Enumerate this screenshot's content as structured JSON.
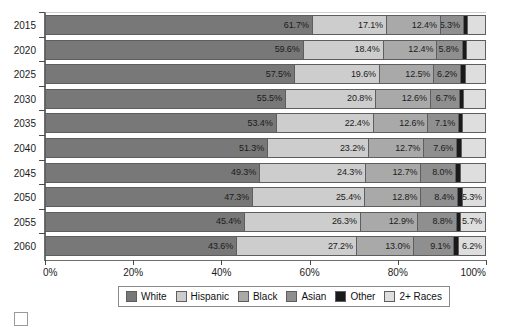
{
  "chart_data": {
    "type": "bar",
    "orientation": "horizontal",
    "stacked": true,
    "stack_mode": "percent",
    "title": "",
    "subtitle": "",
    "xlabel": "",
    "ylabel": "",
    "xlim": [
      0,
      100
    ],
    "grid": false,
    "legend_position": "bottom",
    "categories": [
      "2015",
      "2020",
      "2025",
      "2030",
      "2035",
      "2040",
      "2045",
      "2050",
      "2055",
      "2060"
    ],
    "xticks": [
      0,
      20,
      40,
      60,
      80,
      100
    ],
    "xticklabels": [
      "0%",
      "20%",
      "40%",
      "60%",
      "80%",
      "100%"
    ],
    "series": [
      {
        "name": "White",
        "color": "#787878",
        "values": [
          61.7,
          59.6,
          57.5,
          55.5,
          53.4,
          51.3,
          49.3,
          47.3,
          45.4,
          43.6
        ]
      },
      {
        "name": "Hispanic",
        "color": "#cdcdcd",
        "values": [
          17.1,
          18.4,
          19.6,
          20.8,
          22.4,
          23.2,
          24.3,
          25.4,
          26.3,
          27.2
        ]
      },
      {
        "name": "Black",
        "color": "#a9a9a9",
        "values": [
          12.4,
          12.4,
          12.5,
          12.6,
          12.6,
          12.7,
          12.7,
          12.8,
          12.9,
          13.0
        ]
      },
      {
        "name": "Asian",
        "color": "#8f8f8f",
        "values": [
          5.3,
          5.8,
          6.2,
          6.7,
          7.1,
          7.6,
          8.0,
          8.4,
          8.8,
          9.1
        ]
      },
      {
        "name": "Other",
        "color": "#1a1a1a",
        "values": [
          1.0,
          1.0,
          1.0,
          1.0,
          1.0,
          1.0,
          1.0,
          1.0,
          1.0,
          1.0
        ]
      },
      {
        "name": "2+ Races",
        "color": "#dedede",
        "values": [
          4.1,
          4.4,
          4.7,
          5.0,
          5.2,
          5.6,
          5.8,
          5.3,
          5.7,
          6.2
        ]
      }
    ],
    "bar_labels": [
      [
        "61.7%",
        "17.1%",
        "12.4%",
        "5.3%",
        "",
        ""
      ],
      [
        "59.6%",
        "18.4%",
        "12.4%",
        "5.8%",
        "",
        ""
      ],
      [
        "57.5%",
        "19.6%",
        "12.5%",
        "6.2%",
        "",
        ""
      ],
      [
        "55.5%",
        "20.8%",
        "12.6%",
        "6.7%",
        "",
        ""
      ],
      [
        "53.4%",
        "22.4%",
        "12.6%",
        "7.1%",
        "",
        ""
      ],
      [
        "51.3%",
        "23.2%",
        "12.7%",
        "7.6%",
        "",
        ""
      ],
      [
        "49.3%",
        "24.3%",
        "12.7%",
        "8.0%",
        "",
        ""
      ],
      [
        "47.3%",
        "25.4%",
        "12.8%",
        "8.4%",
        "",
        "5.3%"
      ],
      [
        "45.4%",
        "26.3%",
        "12.9%",
        "8.8%",
        "",
        "5.7%"
      ],
      [
        "43.6%",
        "27.2%",
        "13.0%",
        "9.1%",
        "",
        "6.2%"
      ]
    ]
  },
  "legend": {
    "items": [
      {
        "label": "White",
        "color": "#787878"
      },
      {
        "label": "Hispanic",
        "color": "#cdcdcd"
      },
      {
        "label": "Black",
        "color": "#a9a9a9"
      },
      {
        "label": "Asian",
        "color": "#8f8f8f"
      },
      {
        "label": "Other",
        "color": "#1a1a1a"
      },
      {
        "label": "2+ Races",
        "color": "#dedede"
      }
    ]
  }
}
